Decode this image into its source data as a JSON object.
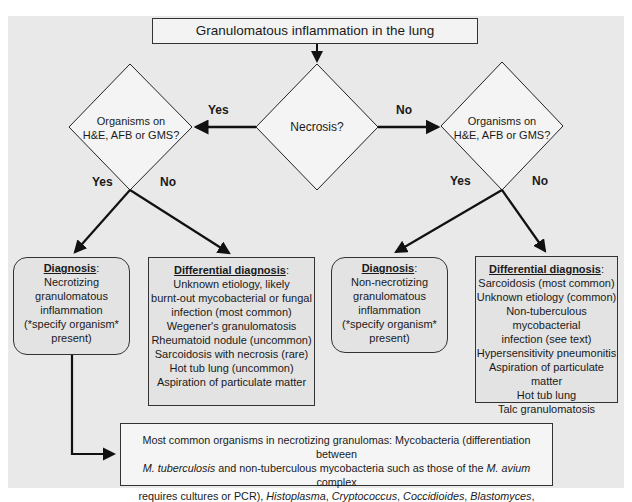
{
  "title": "Granulomatous inflammation in the lung",
  "center_decision": {
    "label": "Necrosis?"
  },
  "edges": {
    "necrosis_yes": "Yes",
    "necrosis_no": "No",
    "left_yes": "Yes",
    "left_no": "No",
    "right_yes": "Yes",
    "right_no": "No"
  },
  "left_decision": {
    "line1": "Organisms on",
    "line2": "H&E, AFB or GMS?"
  },
  "right_decision": {
    "line1": "Organisms on",
    "line2": "H&E, AFB or GMS?"
  },
  "diagnosis_left": {
    "heading": "Diagnosis",
    "lines": [
      "Necrotizing",
      "granulomatous",
      "inflammation",
      "(*specify organism*",
      "present)"
    ]
  },
  "ddx_left": {
    "heading": "Differential diagnosis",
    "lines": [
      "Unknown etiology, likely",
      "burnt-out mycobacterial or fungal",
      "infection (most common)",
      "Wegener's granulomatosis",
      "Rheumatoid nodule (uncommon)",
      "Sarcoidosis with necrosis (rare)",
      "Hot tub lung (uncommon)",
      "Aspiration of particulate matter"
    ]
  },
  "diagnosis_right": {
    "heading": "Diagnosis",
    "lines": [
      "Non-necrotizing",
      "granulomatous",
      "inflammation",
      "(*specify organism*",
      "present)"
    ]
  },
  "ddx_right": {
    "heading": "Differential diagnosis",
    "lines": [
      "Sarcoidosis (most common)",
      "Unknown etiology (common)",
      "Non-tuberculous mycobacterial",
      "infection (see text)",
      "Hypersensitivity pneumonitis",
      "Aspiration of particulate matter",
      "Hot tub lung",
      "Talc granulomatosis"
    ]
  },
  "organisms": {
    "l1": "Most common organisms in necrotizing granulomas: Mycobacteria (differentiation between",
    "l2_it1": "M. tuberculosis",
    "l2_t1": " and non-tuberculous mycobacteria such as those of the ",
    "l2_it2": "M. avium",
    "l2_t2": " complex",
    "l3_t1": "requires cultures or PCR), ",
    "l3_it1": "Histoplasma",
    "sep": ", ",
    "l3_it2": "Cryptococcus",
    "l3_it3": "Coccidioides",
    "l3_it4": "Blastomyces",
    "l3_t2": ",",
    "l4_it": "Aspergillus"
  },
  "colors": {
    "background": "#e9e9e9",
    "line": "#111111",
    "box_fill": "#e3e3e3"
  }
}
